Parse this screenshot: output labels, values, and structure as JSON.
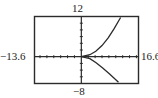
{
  "chart_data": {
    "type": "line",
    "title": "",
    "xlabel": "",
    "ylabel": "",
    "window": {
      "xmin": -13.6,
      "xmax": 16.6,
      "ymin": -8,
      "ymax": 12
    },
    "xlim": [
      -13.6,
      16.6
    ],
    "ylim": [
      -8,
      12
    ],
    "tick_spacing": {
      "x": 2,
      "y": 2
    },
    "grid": false,
    "legend": null,
    "series": [
      {
        "name": "sideways parabola",
        "description": "curve opening to the right with vertex at origin",
        "points": [
          [
            11.4,
            11.7
          ],
          [
            9.5,
            8.3
          ],
          [
            7.8,
            5.6
          ],
          [
            6.0,
            3.3
          ],
          [
            4.2,
            1.6
          ],
          [
            2.5,
            0.6
          ],
          [
            0,
            0
          ],
          [
            2.5,
            -0.6
          ],
          [
            4.3,
            -1.8
          ],
          [
            6.2,
            -3.4
          ],
          [
            8.2,
            -5.2
          ],
          [
            10.8,
            -7.6
          ]
        ]
      }
    ]
  },
  "labels": {
    "ymax": "12",
    "ymin": "−8",
    "xmin": "−13.6",
    "xmax": "16.6"
  },
  "colors": {
    "frame": "#2b2b2b",
    "curve": "#2b2b2b",
    "background": "#ffffff"
  }
}
